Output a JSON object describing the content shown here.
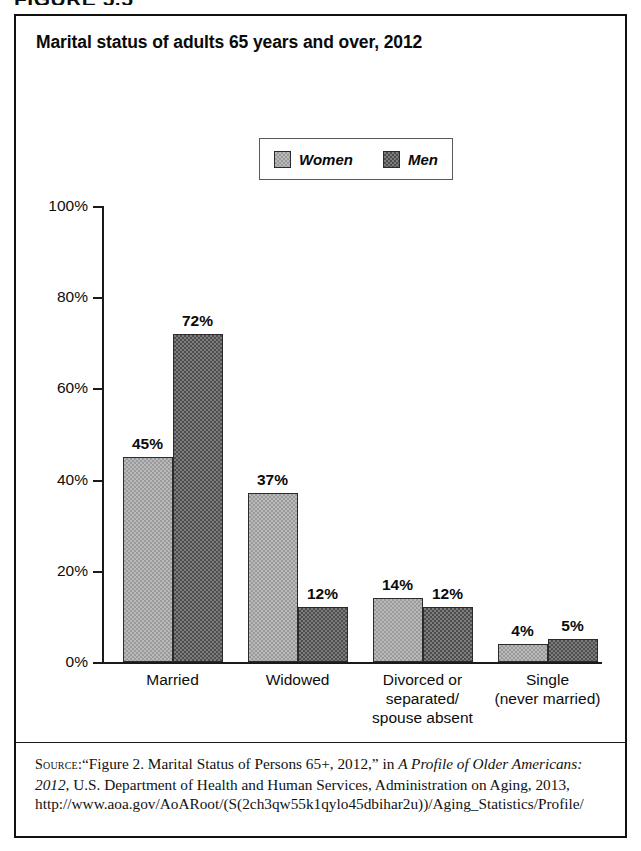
{
  "figure": {
    "caption": "FIGURE 5.5"
  },
  "chart_data": {
    "type": "bar",
    "title": "Marital status of adults 65 years and over, 2012",
    "xlabel": "",
    "ylabel": "",
    "ylim": [
      0,
      100
    ],
    "grid": false,
    "legend_position": "top-center",
    "categories": [
      "Married",
      "Widowed",
      "Divorced or\nseparated/\nspouse absent",
      "Single\n(never married)"
    ],
    "category_lines": [
      [
        "Married"
      ],
      [
        "Widowed"
      ],
      [
        "Divorced or",
        "separated/",
        "spouse absent"
      ],
      [
        "Single",
        "(never married)"
      ]
    ],
    "ytick_labels": [
      "0%",
      "20%",
      "40%",
      "60%",
      "80%",
      "100%"
    ],
    "ytick_values": [
      0,
      20,
      40,
      60,
      80,
      100
    ],
    "series": [
      {
        "name": "Women",
        "color": "#b9b9b9",
        "values": [
          45,
          37,
          14,
          4
        ],
        "data_labels": [
          "45%",
          "37%",
          "14%",
          "4%"
        ]
      },
      {
        "name": "Men",
        "color": "#7d7d7d",
        "values": [
          72,
          12,
          12,
          5
        ],
        "data_labels": [
          "72%",
          "12%",
          "12%",
          "5%"
        ]
      }
    ]
  },
  "source": {
    "label": "Source:",
    "text_part1": "“Figure 2. Marital Status of Persons 65+, 2012,” in ",
    "italic1": "A Profile of Older Americans: 2012",
    "text_part2": ", U.S. Department of Health and Human Services, Administration on Aging, 2013, http://www.aoa.gov/AoARoot/(S(2ch3qw55k1qylo45dbihar2u))/Aging_Statistics/Profile/"
  }
}
